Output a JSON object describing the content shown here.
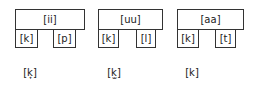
{
  "groups": [
    {
      "vowel": "[ii]",
      "left": "[k]",
      "right": "[p]",
      "allophone": "[k̟]"
    },
    {
      "vowel": "[uu]",
      "left": "[k]",
      "right": "[l]",
      "allophone": "[k̫]"
    },
    {
      "vowel": "[aa]",
      "left": "[k]",
      "right": "[t]",
      "allophone": "[k]"
    }
  ]
}
